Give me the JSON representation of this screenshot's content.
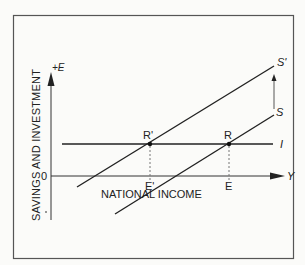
{
  "diagram": {
    "y_axis_label": "SAVINGS AND INVESTMENT",
    "y_axis_symbol": "+E",
    "x_axis_label": "NATIONAL INCOME",
    "x_axis_symbol": "Y",
    "origin_label": "0",
    "negative_label": "–",
    "curves": [
      {
        "name": "S'",
        "label": "S'",
        "description": "shifted savings function"
      },
      {
        "name": "S",
        "label": "S",
        "description": "savings function"
      },
      {
        "name": "I",
        "label": "I",
        "description": "investment function (horizontal)"
      }
    ],
    "points": [
      {
        "name": "R'",
        "label": "R'",
        "description": "intersection of S' and I"
      },
      {
        "name": "R",
        "label": "R",
        "description": "intersection of S and I"
      }
    ],
    "income_marks": [
      {
        "label": "E'"
      },
      {
        "label": "E"
      }
    ],
    "shift_arrow": "upward arrow from S to S'",
    "colors": {
      "line": "#222222",
      "frame": "#555555",
      "background": "#fbfbf9",
      "dashed": "#777777"
    }
  }
}
